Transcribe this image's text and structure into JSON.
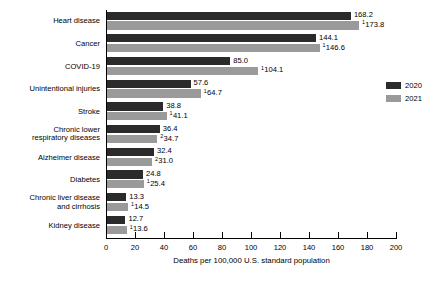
{
  "chart_data": {
    "type": "bar",
    "orientation": "horizontal",
    "title": "",
    "xlabel": "Deaths per 100,000 U.S. standard population",
    "ylabel": "",
    "xlim": [
      0,
      200
    ],
    "xticks": [
      0,
      20,
      40,
      60,
      80,
      100,
      120,
      140,
      160,
      180,
      200
    ],
    "grid": false,
    "legend_position": "right",
    "categories": [
      "Heart disease",
      "Cancer",
      "COVID-19",
      "Unintentional injuries",
      "Stroke",
      "Chronic lower\nrespiratory diseases",
      "Alzheimer disease",
      "Diabetes",
      "Chronic liver disease\nand cirrhosis",
      "Kidney disease"
    ],
    "series": [
      {
        "name": "2020",
        "color": "#2b2b2b",
        "values": [
          168.2,
          144.1,
          85.0,
          57.6,
          38.8,
          36.4,
          32.4,
          24.8,
          13.3,
          12.7
        ]
      },
      {
        "name": "2021",
        "color": "#9a9a9a",
        "values": [
          173.8,
          146.6,
          104.1,
          64.7,
          41.1,
          34.7,
          31.0,
          25.4,
          14.5,
          13.6
        ]
      }
    ]
  },
  "rows": [
    {
      "label": "Heart disease",
      "v2020": 168.2,
      "l2020": "168.2",
      "s2020": "",
      "v2021": 173.8,
      "l2021": "173.8",
      "s2021": "1"
    },
    {
      "label": "Cancer",
      "v2020": 144.1,
      "l2020": "144.1",
      "s2020": "",
      "v2021": 146.6,
      "l2021": "146.6",
      "s2021": "1"
    },
    {
      "label": "COVID-19",
      "v2020": 85.0,
      "l2020": "85.0",
      "s2020": "",
      "v2021": 104.1,
      "l2021": "104.1",
      "s2021": "1"
    },
    {
      "label": "Unintentional injuries",
      "v2020": 57.6,
      "l2020": "57.6",
      "s2020": "",
      "v2021": 64.7,
      "l2021": "64.7",
      "s2021": "1"
    },
    {
      "label": "Stroke",
      "v2020": 38.8,
      "l2020": "38.8",
      "s2020": "",
      "v2021": 41.1,
      "l2021": "41.1",
      "s2021": "1"
    },
    {
      "label": "Chronic lower\nrespiratory diseases",
      "v2020": 36.4,
      "l2020": "36.4",
      "s2020": "",
      "v2021": 34.7,
      "l2021": "34.7",
      "s2021": "2"
    },
    {
      "label": "Alzheimer disease",
      "v2020": 32.4,
      "l2020": "32.4",
      "s2020": "",
      "v2021": 31.0,
      "l2021": "31.0",
      "s2021": "2"
    },
    {
      "label": "Diabetes",
      "v2020": 24.8,
      "l2020": "24.8",
      "s2020": "",
      "v2021": 25.4,
      "l2021": "25.4",
      "s2021": "1"
    },
    {
      "label": "Chronic liver disease\nand cirrhosis",
      "v2020": 13.3,
      "l2020": "13.3",
      "s2020": "",
      "v2021": 14.5,
      "l2021": "14.5",
      "s2021": "1"
    },
    {
      "label": "Kidney disease",
      "v2020": 12.7,
      "l2020": "12.7",
      "s2020": "",
      "v2021": 13.6,
      "l2021": "13.6",
      "s2021": "1"
    }
  ],
  "axis": {
    "ticks": [
      "0",
      "20",
      "40",
      "60",
      "80",
      "100",
      "120",
      "140",
      "160",
      "180",
      "200"
    ],
    "title": "Deaths per 100,000 U.S. standard population"
  },
  "legend": {
    "items": [
      {
        "label": "2020",
        "color": "#2b2b2b"
      },
      {
        "label": "2021",
        "color": "#9a9a9a"
      }
    ]
  }
}
